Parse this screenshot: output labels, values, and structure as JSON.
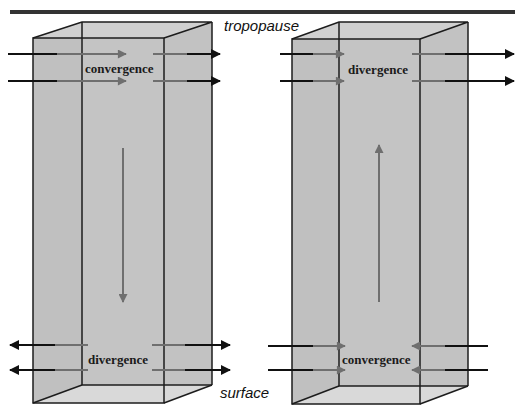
{
  "labels": {
    "top": "tropopause",
    "bottom": "surface"
  },
  "left_column": {
    "upper_label": "convergence",
    "lower_label": "divergence",
    "vertical_motion": "downward",
    "upper_flow": "inward",
    "lower_flow": "outward"
  },
  "right_column": {
    "upper_label": "divergence",
    "lower_label": "convergence",
    "vertical_motion": "upward",
    "upper_flow": "outward",
    "lower_flow": "inward"
  },
  "colors": {
    "box_fill": "#c4c4c4",
    "box_top": "#d2d2d2",
    "box_bottom": "#d9d9d9",
    "edge": "#1c1c1c",
    "inner_arrow": "#6f6f6f",
    "outer_arrow": "#111111",
    "tropopause_line": "#333333"
  }
}
